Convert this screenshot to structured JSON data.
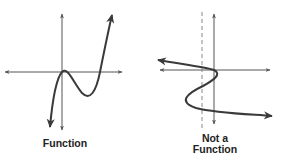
{
  "colors": {
    "axis": "#555555",
    "curve": "#3a3a3a",
    "dashed": "#888888",
    "text": "#222222",
    "background": "#ffffff"
  },
  "panels": [
    {
      "id": "function",
      "label": "Function",
      "description": "Cubic-like curve passing vertical line test"
    },
    {
      "id": "not-a-function",
      "label_line1": "Not a",
      "label_line2": "Function",
      "description": "Sideways S-curve failing vertical line test (dashed vertical line intersects curve multiple times)"
    }
  ]
}
